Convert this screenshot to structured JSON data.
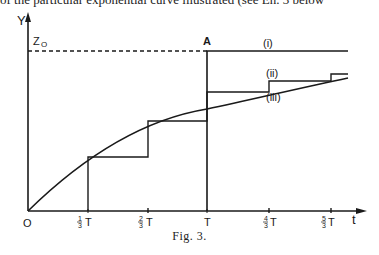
{
  "top_text": "of the particular exponential curve illustrated (see En. 3 below",
  "figure": {
    "caption": "Fig. 3.",
    "y_axis_label": "Y",
    "x_axis_label": "t",
    "origin_label": "O",
    "z0_label": "Z",
    "z0_subscript": "O",
    "point_a_label": "A",
    "curve_labels": {
      "i": "(i)",
      "ii": "(ii)",
      "iii": "(iii)"
    },
    "x_ticks": [
      {
        "num": "1",
        "den": "3",
        "unit": "T"
      },
      {
        "num": "2",
        "den": "3",
        "unit": "T"
      },
      {
        "num": "",
        "den": "",
        "unit": "T"
      },
      {
        "num": "4",
        "den": "3",
        "unit": "T"
      },
      {
        "num": "5",
        "den": "3",
        "unit": "T"
      }
    ],
    "colors": {
      "ink": "#1a1a1a",
      "background": "#ffffff"
    }
  }
}
